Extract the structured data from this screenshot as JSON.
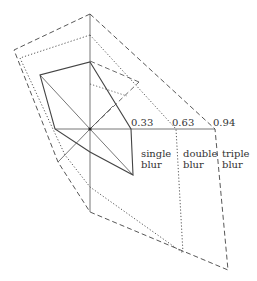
{
  "diagram": {
    "center": [
      90,
      129
    ],
    "colors": {
      "line": "#444444",
      "axis": "#666666"
    },
    "axes": [
      [
        90,
        14
      ],
      [
        215,
        129
      ],
      [
        90,
        212
      ],
      [
        55,
        129
      ],
      [
        40,
        75
      ],
      [
        133,
        175
      ],
      [
        58,
        162
      ],
      [
        113,
        106
      ]
    ],
    "series": [
      {
        "name": "single blur",
        "style": "solid",
        "points": [
          [
            90,
            62
          ],
          [
            131,
            129
          ],
          [
            133,
            175
          ],
          [
            90,
            152
          ],
          [
            55,
            129
          ],
          [
            40,
            75
          ]
        ]
      },
      {
        "name": "double blur",
        "style": "dotted",
        "points": [
          [
            90,
            35
          ],
          [
            176,
            129
          ],
          [
            183,
            253
          ],
          [
            90,
            187
          ],
          [
            65,
            155
          ],
          [
            20,
            58
          ]
        ]
      },
      {
        "name": "triple blur",
        "style": "dashed",
        "points": [
          [
            90,
            14
          ],
          [
            215,
            129
          ],
          [
            228,
            270
          ],
          [
            90,
            212
          ],
          [
            58,
            162
          ],
          [
            14,
            50
          ]
        ]
      }
    ],
    "diagonal_marks": [
      {
        "style": "dashed",
        "from": [
          90,
          129
        ],
        "to": [
          139,
          82
        ]
      },
      {
        "style": "dashed",
        "from": [
          139,
          82
        ],
        "to": [
          90,
          61
        ]
      },
      {
        "style": "dotted",
        "from": [
          90,
          84
        ],
        "to": [
          127,
          96
        ]
      }
    ],
    "scale_labels": [
      {
        "text": "0.33",
        "x": 131,
        "y": 118
      },
      {
        "text": "0.63",
        "x": 172,
        "y": 118
      },
      {
        "text": "0.94",
        "x": 213,
        "y": 118
      }
    ],
    "series_labels": [
      {
        "text": "single\nblur",
        "x": 141,
        "y": 148
      },
      {
        "text": "double\nblur",
        "x": 183,
        "y": 148
      },
      {
        "text": "triple\nblur",
        "x": 222,
        "y": 148
      }
    ]
  }
}
